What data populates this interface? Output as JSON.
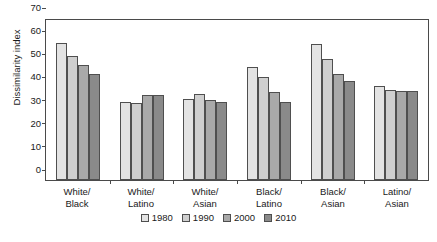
{
  "chart_data": {
    "type": "bar",
    "title": "",
    "xlabel": "",
    "ylabel": "Dissimilarity index",
    "ylim": [
      0,
      70
    ],
    "yticks": [
      0,
      10,
      20,
      30,
      40,
      50,
      60,
      70
    ],
    "grid": false,
    "legend_position": "bottom",
    "categories": [
      "White/ Black",
      "White/ Latino",
      "White/ Asian",
      "Black/ Latino",
      "Black/ Asian",
      "Latino/ Asian"
    ],
    "category_lines": [
      {
        "line1": "White/",
        "line2": "Black"
      },
      {
        "line1": "White/",
        "line2": "Latino"
      },
      {
        "line1": "White/",
        "line2": "Asian"
      },
      {
        "line1": "Black/",
        "line2": "Latino"
      },
      {
        "line1": "Black/",
        "line2": "Asian"
      },
      {
        "line1": "Latino/",
        "line2": "Asian"
      }
    ],
    "series": [
      {
        "name": "1980",
        "color": "#e3e3e3",
        "values": [
          59.3,
          33.6,
          35.1,
          48.8,
          58.6,
          40.5
        ]
      },
      {
        "name": "1990",
        "color": "#cfcfcf",
        "values": [
          53.6,
          33.4,
          37.1,
          44.3,
          52.3,
          39.1
        ]
      },
      {
        "name": "2000",
        "color": "#a9a9a9",
        "values": [
          49.5,
          36.9,
          34.6,
          38.2,
          45.8,
          38.4
        ]
      },
      {
        "name": "2010",
        "color": "#8a8a8a",
        "values": [
          46.0,
          36.6,
          33.5,
          33.8,
          42.9,
          38.3
        ]
      }
    ]
  },
  "legend": {
    "entries": [
      "1980",
      "1990",
      "2000",
      "2010"
    ]
  },
  "axis": {
    "y_title": "Dissimilarity index",
    "tick_labels": [
      "70",
      "60",
      "50",
      "40",
      "30",
      "20",
      "10",
      "0"
    ]
  },
  "colors": {
    "axis": "#4a4a4a",
    "bar_border": "#4f4f4f",
    "background": "#ffffff",
    "text": "#1a1a1a"
  }
}
